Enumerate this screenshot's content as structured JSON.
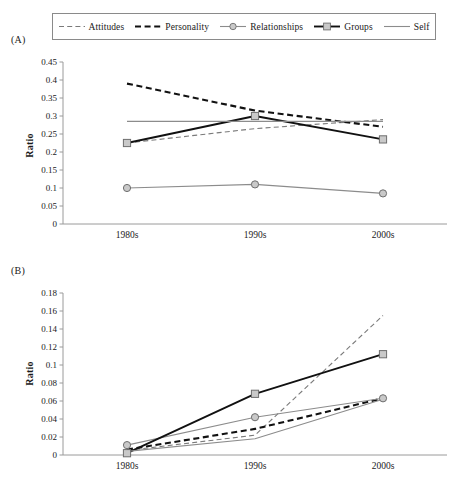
{
  "legend": {
    "items": [
      {
        "label": "Attitudes",
        "style": "thin-dashed",
        "marker": "none",
        "color": "#7a7a7a",
        "icon": "thin-dashed-line-icon"
      },
      {
        "label": "Personality",
        "style": "thick-dashed",
        "marker": "none",
        "color": "#111111",
        "icon": "thick-dashed-line-icon"
      },
      {
        "label": "Relationships",
        "style": "thin-solid",
        "marker": "circle",
        "color": "#8c8c8c",
        "icon": "circle-marker-line-icon"
      },
      {
        "label": "Groups",
        "style": "thick-solid",
        "marker": "square",
        "color": "#111111",
        "icon": "square-marker-line-icon"
      },
      {
        "label": "Self",
        "style": "thin-solid",
        "marker": "none",
        "color": "#8c8c8c",
        "icon": "solid-line-icon"
      }
    ]
  },
  "panels": {
    "a_label": "(A)",
    "b_label": "(B)"
  },
  "chart_data": [
    {
      "id": "panel-a",
      "type": "line",
      "title": "(A)",
      "xlabel": "",
      "ylabel": "Ratio",
      "categories": [
        "1980s",
        "1990s",
        "2000s"
      ],
      "ylim": [
        0,
        0.45
      ],
      "yticks": [
        0,
        0.05,
        0.1,
        0.15,
        0.2,
        0.25,
        0.3,
        0.35,
        0.4,
        0.45
      ],
      "ytick_labels": [
        "0",
        "0.05",
        "0.1",
        "0.15",
        "0.2",
        "0.25",
        "0.3",
        "0.35",
        "0.4",
        "0.45"
      ],
      "grid": false,
      "legend_position": "top",
      "series": [
        {
          "name": "Attitudes",
          "values": [
            0.225,
            0.265,
            0.29
          ],
          "style": "thin-dashed",
          "marker": "none",
          "color": "#7a7a7a"
        },
        {
          "name": "Personality",
          "values": [
            0.39,
            0.315,
            0.27
          ],
          "style": "thick-dashed",
          "marker": "none",
          "color": "#111111"
        },
        {
          "name": "Relationships",
          "values": [
            0.1,
            0.11,
            0.085
          ],
          "style": "thin-solid",
          "marker": "circle",
          "color": "#8c8c8c"
        },
        {
          "name": "Groups",
          "values": [
            0.225,
            0.3,
            0.235
          ],
          "style": "thick-solid",
          "marker": "square",
          "color": "#111111"
        },
        {
          "name": "Self",
          "values": [
            0.285,
            0.285,
            0.285
          ],
          "style": "thin-solid",
          "marker": "none",
          "color": "#8c8c8c"
        }
      ]
    },
    {
      "id": "panel-b",
      "type": "line",
      "title": "(B)",
      "xlabel": "",
      "ylabel": "Ratio",
      "categories": [
        "1980s",
        "1990s",
        "2000s"
      ],
      "ylim": [
        0,
        0.18
      ],
      "yticks": [
        0,
        0.02,
        0.04,
        0.06,
        0.08,
        0.1,
        0.12,
        0.14,
        0.16,
        0.18
      ],
      "ytick_labels": [
        "0",
        "0.02",
        "0.04",
        "0.06",
        "0.08",
        "0.1",
        "0.12",
        "0.14",
        "0.16",
        "0.18"
      ],
      "grid": false,
      "legend_position": "top",
      "series": [
        {
          "name": "Attitudes",
          "values": [
            0.005,
            0.022,
            0.155
          ],
          "style": "thin-dashed",
          "marker": "none",
          "color": "#7a7a7a"
        },
        {
          "name": "Personality",
          "values": [
            0.006,
            0.029,
            0.063
          ],
          "style": "thick-dashed",
          "marker": "none",
          "color": "#111111"
        },
        {
          "name": "Relationships",
          "values": [
            0.011,
            0.042,
            0.063
          ],
          "style": "thin-solid",
          "marker": "circle",
          "color": "#8c8c8c"
        },
        {
          "name": "Groups",
          "values": [
            0.002,
            0.068,
            0.112
          ],
          "style": "thick-solid",
          "marker": "square",
          "color": "#111111"
        },
        {
          "name": "Self",
          "values": [
            0.004,
            0.018,
            0.062
          ],
          "style": "thin-solid",
          "marker": "none",
          "color": "#8c8c8c"
        }
      ]
    }
  ]
}
